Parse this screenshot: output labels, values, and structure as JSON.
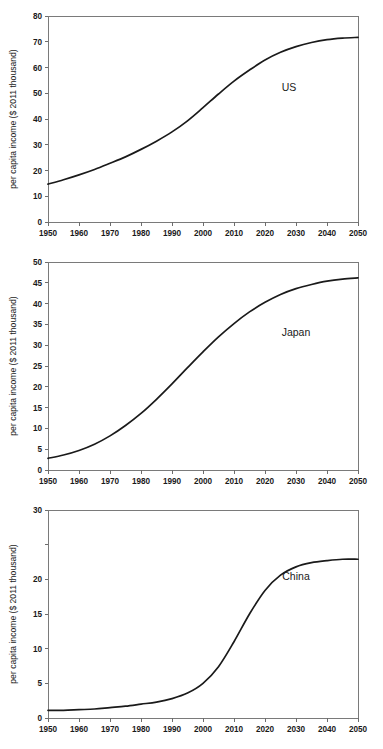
{
  "figure": {
    "panel_count": 3,
    "shared_xlabel_ticks": [
      "1950",
      "1960",
      "1970",
      "1980",
      "1990",
      "2000",
      "2010",
      "2020",
      "2030",
      "2040",
      "2050"
    ],
    "shared_ylabel": "per capita income ($ 2011 thousand)",
    "curve_color": "#1a1a1a",
    "axis_color": "#6d6d6d",
    "background": "#ffffff"
  },
  "chart_data": [
    {
      "id": "us",
      "type": "line",
      "title": "",
      "annotation": "US",
      "xlabel": "",
      "ylabel": "per capita income ($ 2011 thousand)",
      "xlim": [
        1950,
        2050
      ],
      "ylim": [
        0,
        80
      ],
      "grid": false,
      "legend_position": "inline-annotation",
      "xticks": [
        1950,
        1960,
        1970,
        1980,
        1990,
        2000,
        2010,
        2020,
        2030,
        2040,
        2050
      ],
      "xticklabels": [
        "1950",
        "1960",
        "1970",
        "1980",
        "1990",
        "2000",
        "2010",
        "2020",
        "2030",
        "2040",
        "2050"
      ],
      "yticks": [
        0,
        10,
        20,
        30,
        40,
        50,
        60,
        70,
        80
      ],
      "yticklabels": [
        "0",
        "10",
        "20",
        "30",
        "40",
        "50",
        "60",
        "70",
        "80"
      ],
      "series": [
        {
          "name": "US",
          "x": [
            1950,
            1955,
            1960,
            1965,
            1970,
            1975,
            1980,
            1985,
            1990,
            1995,
            2000,
            2005,
            2010,
            2015,
            2020,
            2025,
            2030,
            2035,
            2040,
            2045,
            2050
          ],
          "values": [
            14.7,
            16.4,
            18.3,
            20.4,
            22.8,
            25.3,
            28.2,
            31.4,
            35.0,
            39.3,
            44.4,
            49.7,
            54.7,
            59.0,
            62.9,
            65.9,
            68.1,
            69.7,
            70.8,
            71.4,
            71.7
          ]
        }
      ]
    },
    {
      "id": "japan",
      "type": "line",
      "title": "",
      "annotation": "Japan",
      "xlabel": "",
      "ylabel": "per capita income ($ 2011 thousand)",
      "xlim": [
        1950,
        2050
      ],
      "ylim": [
        0,
        50
      ],
      "grid": false,
      "legend_position": "inline-annotation",
      "xticks": [
        1950,
        1960,
        1970,
        1980,
        1990,
        2000,
        2010,
        2020,
        2030,
        2040,
        2050
      ],
      "xticklabels": [
        "1950",
        "1960",
        "1970",
        "1980",
        "1990",
        "2000",
        "2010",
        "2020",
        "2030",
        "2040",
        "2050"
      ],
      "yticks": [
        0,
        5,
        10,
        15,
        20,
        25,
        30,
        35,
        40,
        45,
        50
      ],
      "yticklabels": [
        "0",
        "5",
        "10",
        "15",
        "20",
        "25",
        "30",
        "35",
        "40",
        "45",
        "50"
      ],
      "series": [
        {
          "name": "Japan",
          "x": [
            1950,
            1955,
            1960,
            1965,
            1970,
            1975,
            1980,
            1985,
            1990,
            1995,
            2000,
            2005,
            2010,
            2015,
            2020,
            2025,
            2030,
            2035,
            2040,
            2045,
            2050
          ],
          "values": [
            2.8,
            3.6,
            4.7,
            6.2,
            8.2,
            10.7,
            13.6,
            17.0,
            20.7,
            24.6,
            28.4,
            32.0,
            35.2,
            38.0,
            40.3,
            42.2,
            43.6,
            44.6,
            45.4,
            45.9,
            46.2
          ]
        }
      ]
    },
    {
      "id": "china",
      "type": "line",
      "title": "",
      "annotation": "China",
      "xlabel": "",
      "ylabel": "per capita income ($ 2011 thousand)",
      "xlim": [
        1950,
        2050
      ],
      "ylim": [
        0,
        30
      ],
      "grid": false,
      "legend_position": "inline-annotation",
      "xticks": [
        1950,
        1960,
        1970,
        1980,
        1990,
        2000,
        2010,
        2020,
        2030,
        2040,
        2050
      ],
      "xticklabels": [
        "1950",
        "1960",
        "1970",
        "1980",
        "1990",
        "2000",
        "2010",
        "2020",
        "2030",
        "2040",
        "2050"
      ],
      "yticks": [
        0,
        5,
        10,
        15,
        20,
        25,
        30
      ],
      "yticklabels": [
        "0",
        "5",
        "10",
        "15",
        "20",
        "",
        "30"
      ],
      "series": [
        {
          "name": "China",
          "x": [
            1950,
            1955,
            1960,
            1965,
            1970,
            1975,
            1980,
            1985,
            1990,
            1995,
            2000,
            2005,
            2010,
            2015,
            2020,
            2025,
            2030,
            2035,
            2040,
            2045,
            2050
          ],
          "values": [
            1.1,
            1.1,
            1.2,
            1.3,
            1.5,
            1.7,
            2.0,
            2.3,
            2.8,
            3.6,
            5.0,
            7.4,
            11.0,
            15.0,
            18.4,
            20.6,
            21.8,
            22.4,
            22.7,
            22.9,
            22.9
          ]
        }
      ]
    }
  ]
}
